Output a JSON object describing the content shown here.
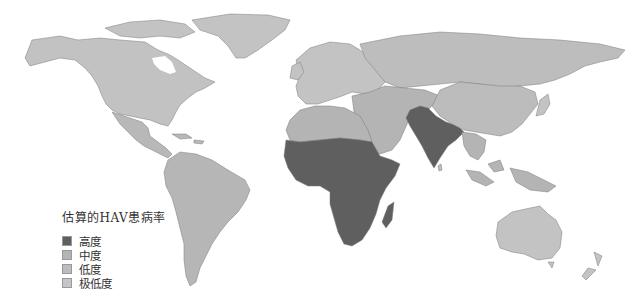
{
  "legend": {
    "title": "估算的HAV患病率",
    "items": [
      {
        "label": "高度",
        "color": "#5f5f5f"
      },
      {
        "label": "中度",
        "color": "#b4b4b4"
      },
      {
        "label": "低度",
        "color": "#bcbcbc"
      },
      {
        "label": "极低度",
        "color": "#c6c6c6"
      }
    ]
  },
  "regions": {
    "high": [
      "Sub-Saharan Africa",
      "South Asia"
    ],
    "intermediate": [
      "North Africa",
      "Middle East",
      "Central Asia",
      "Latin America",
      "Southeast Asia",
      "Eastern Europe"
    ],
    "low": [
      "China",
      "Russia"
    ],
    "very_low": [
      "North America",
      "Western Europe",
      "Australia",
      "Japan",
      "Greenland"
    ]
  },
  "colors": {
    "background": "#ffffff",
    "land_default": "#bdbdbd",
    "high": "#5f5f5f",
    "border": "#7a7a7a"
  }
}
